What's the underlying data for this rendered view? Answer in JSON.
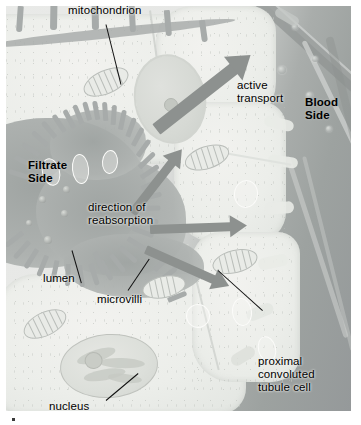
{
  "figure": {
    "type": "histology-diagram"
  },
  "labels": {
    "mitochondrion": "mitochondrion",
    "active_transport": "active\ntransport",
    "blood_side": "Blood\nSide",
    "filtrate_side": "Filtrate\nSide",
    "direction_of_reabsorption": "direction of\nreabsorption",
    "lumen": "lumen",
    "microvilli": "microvilli",
    "nucleus": "nucleus",
    "proximal_convoluted_tubule_cell": "proximal\nconvoluted\ntubule cell"
  },
  "colors": {
    "plate_background": "#b9bcbb",
    "cytoplasm": "#eceeea",
    "lumen_fill": "#a7abaa",
    "blood_field": "#9da2a0",
    "arrow": "#8d918f",
    "label_text": "#000000",
    "leader_line": "#111111"
  },
  "structures": {
    "arrows": [
      {
        "name": "active-transport-arrow",
        "label": "active transport",
        "direction": "up-right"
      },
      {
        "name": "reabsorption-arrow-up",
        "label": "direction of reabsorption",
        "direction": "up-right"
      },
      {
        "name": "reabsorption-arrow-right",
        "label": "direction of reabsorption",
        "direction": "right"
      },
      {
        "name": "reabsorption-arrow-down",
        "label": "direction of reabsorption",
        "direction": "down-right"
      }
    ],
    "organelles": [
      "mitochondrion",
      "nucleus",
      "vesicle",
      "microvilli",
      "lumen"
    ],
    "sides": [
      "Filtrate Side",
      "Blood Side"
    ]
  }
}
